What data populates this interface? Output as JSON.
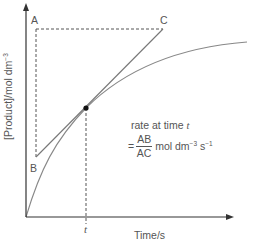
{
  "diagram": {
    "type": "rate-tangent-diagram",
    "y_axis_label": {
      "text": "[Product]/mol dm",
      "exponent": "−3"
    },
    "x_axis_label": "Time/s",
    "points": {
      "A": "A",
      "B": "B",
      "C": "C"
    },
    "time_marker": "t",
    "annotation": {
      "line1_prefix": "rate at time ",
      "line1_var": "t",
      "equals": "=",
      "numerator": "AB",
      "denominator": "AC",
      "units_prefix": "mol dm",
      "units_exp1": "−3",
      "units_mid": " s",
      "units_exp2": "−1"
    },
    "colors": {
      "axis": "#333333",
      "curve": "#888888",
      "tangent": "#777777",
      "dashed": "#555555",
      "point": "#111111",
      "text": "#555555"
    },
    "geometry": {
      "origin": [
        26,
        217
      ],
      "tangent_point": [
        86,
        108
      ],
      "A": [
        36,
        29
      ],
      "B": [
        36,
        157
      ],
      "C": [
        163,
        29
      ],
      "curve_end": [
        247,
        42
      ]
    }
  }
}
